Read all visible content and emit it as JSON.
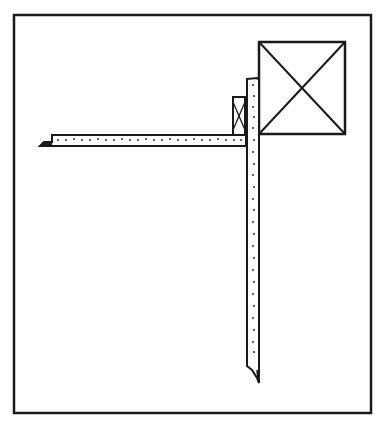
{
  "figure": {
    "type": "line-drawing",
    "stroke_color": "#1a1a1a",
    "background": "#ffffff",
    "frame": {
      "x": 14,
      "y": 15,
      "w": 357,
      "h": 398
    },
    "large_box": {
      "x": 259,
      "y": 42,
      "w": 86,
      "h": 92,
      "marking": "X"
    },
    "small_box": {
      "x": 233,
      "y": 97,
      "w": 12,
      "h": 38,
      "marking": "X"
    },
    "horizontal_bar": {
      "x": 50,
      "y": 135,
      "w": 196,
      "h": 11,
      "dotted": true
    },
    "vertical_bar": {
      "x": 247,
      "y": 78,
      "w": 12,
      "h": 292,
      "dotted": true
    }
  }
}
